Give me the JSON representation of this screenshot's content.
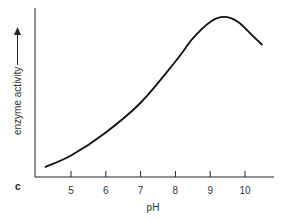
{
  "panel_label": "c",
  "chart_data": {
    "type": "line",
    "title": "",
    "xlabel": "pH",
    "ylabel": "enzyme activity",
    "ylabel_arrow": true,
    "x_ticks": [
      5,
      6,
      7,
      8,
      9,
      10
    ],
    "xlim": [
      4,
      11
    ],
    "y_ticks": [],
    "grid": false,
    "legend": null,
    "series": [
      {
        "name": "enzyme activity",
        "x": [
          4.25,
          5,
          6,
          7,
          8,
          8.5,
          9,
          9.4,
          9.8,
          10.2,
          10.5
        ],
        "y": [
          0.06,
          0.13,
          0.27,
          0.45,
          0.7,
          0.84,
          0.94,
          0.97,
          0.94,
          0.86,
          0.8
        ]
      }
    ]
  }
}
